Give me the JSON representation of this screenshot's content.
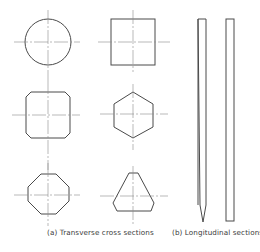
{
  "figure": {
    "captions": {
      "transverse": "(a) Transverse cross sections",
      "longitudinal": "(b) Longitudinal sections"
    },
    "transverse_sections": [
      {
        "shape": "circle",
        "row": 1,
        "column": 1
      },
      {
        "shape": "square",
        "row": 1,
        "column": 2
      },
      {
        "shape": "chamfered-square",
        "row": 2,
        "column": 1
      },
      {
        "shape": "hexagon",
        "row": 2,
        "column": 2
      },
      {
        "shape": "octagon",
        "row": 3,
        "column": 1
      },
      {
        "shape": "truncated-triangle",
        "row": 3,
        "column": 2
      }
    ],
    "longitudinal_sections": [
      {
        "shape": "pointed-strip"
      },
      {
        "shape": "rectangular-strip"
      }
    ],
    "colors": {
      "outline": "#4a4a4a",
      "centerline": "#8a8a8a",
      "text": "#3a3a3a",
      "background": "#ffffff"
    }
  }
}
